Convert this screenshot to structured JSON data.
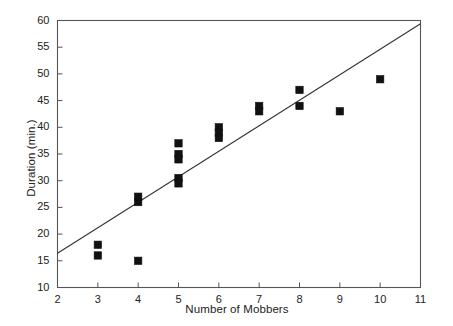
{
  "chart_data": {
    "type": "scatter",
    "title": "",
    "xlabel": "Number of Mobbers",
    "ylabel": "Duration (min.)",
    "xlim": [
      2,
      11
    ],
    "ylim": [
      10,
      60
    ],
    "xticks": [
      2,
      3,
      4,
      5,
      6,
      7,
      8,
      9,
      10,
      11
    ],
    "yticks": [
      10,
      15,
      20,
      25,
      30,
      35,
      40,
      45,
      50,
      55,
      60
    ],
    "grid": false,
    "legend": null,
    "marker": "filled-square",
    "marker_color": "#111111",
    "points": [
      {
        "x": 3,
        "y": 18
      },
      {
        "x": 3,
        "y": 16
      },
      {
        "x": 4,
        "y": 27
      },
      {
        "x": 4,
        "y": 26
      },
      {
        "x": 4,
        "y": 15
      },
      {
        "x": 5,
        "y": 37
      },
      {
        "x": 5,
        "y": 35
      },
      {
        "x": 5,
        "y": 34
      },
      {
        "x": 5,
        "y": 30.5
      },
      {
        "x": 5,
        "y": 29.5
      },
      {
        "x": 6,
        "y": 40
      },
      {
        "x": 6,
        "y": 39
      },
      {
        "x": 6,
        "y": 38
      },
      {
        "x": 7,
        "y": 44
      },
      {
        "x": 7,
        "y": 43
      },
      {
        "x": 8,
        "y": 47
      },
      {
        "x": 8,
        "y": 44
      },
      {
        "x": 9,
        "y": 43
      },
      {
        "x": 10,
        "y": 49
      }
    ],
    "trendline": {
      "type": "linear-fit",
      "x_start": 2,
      "y_start": 16.4,
      "x_end": 11,
      "y_end": 59.4,
      "color": "#333333"
    },
    "xtick_labels": [
      "2",
      "3",
      "4",
      "5",
      "6",
      "7",
      "8",
      "9",
      "10",
      "11"
    ],
    "ytick_labels": [
      "10",
      "15",
      "20",
      "25",
      "30",
      "35",
      "40",
      "45",
      "50",
      "55",
      "60"
    ]
  },
  "colors": {
    "axis": "#555555",
    "marker": "#111111",
    "line": "#333333",
    "background": "#ffffff"
  }
}
